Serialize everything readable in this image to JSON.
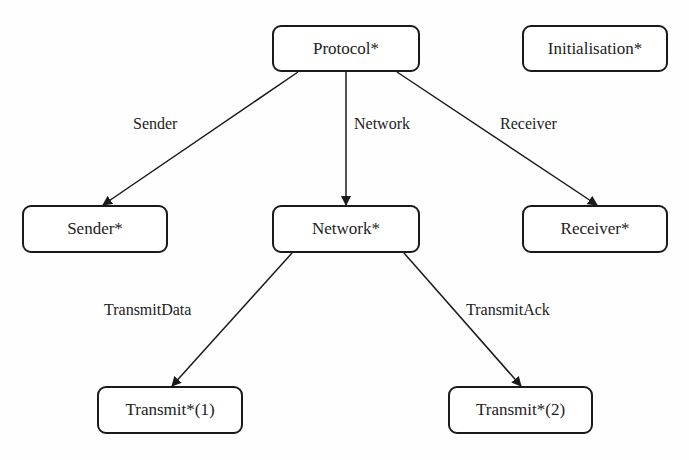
{
  "diagram": {
    "type": "hierarchy",
    "nodes": {
      "protocol": "Protocol*",
      "initialisation": "Initialisation*",
      "sender": "Sender*",
      "network": "Network*",
      "receiver": "Receiver*",
      "transmit1": "Transmit*(1)",
      "transmit2": "Transmit*(2)"
    },
    "edges": {
      "sender": "Sender",
      "network": "Network",
      "receiver": "Receiver",
      "transmit_data": "TransmitData",
      "transmit_ack": "TransmitAck"
    },
    "edge_list": [
      {
        "from": "Protocol*",
        "to": "Sender*",
        "label": "Sender"
      },
      {
        "from": "Protocol*",
        "to": "Network*",
        "label": "Network"
      },
      {
        "from": "Protocol*",
        "to": "Receiver*",
        "label": "Receiver"
      },
      {
        "from": "Network*",
        "to": "Transmit*(1)",
        "label": "TransmitData"
      },
      {
        "from": "Network*",
        "to": "Transmit*(2)",
        "label": "TransmitAck"
      }
    ]
  }
}
